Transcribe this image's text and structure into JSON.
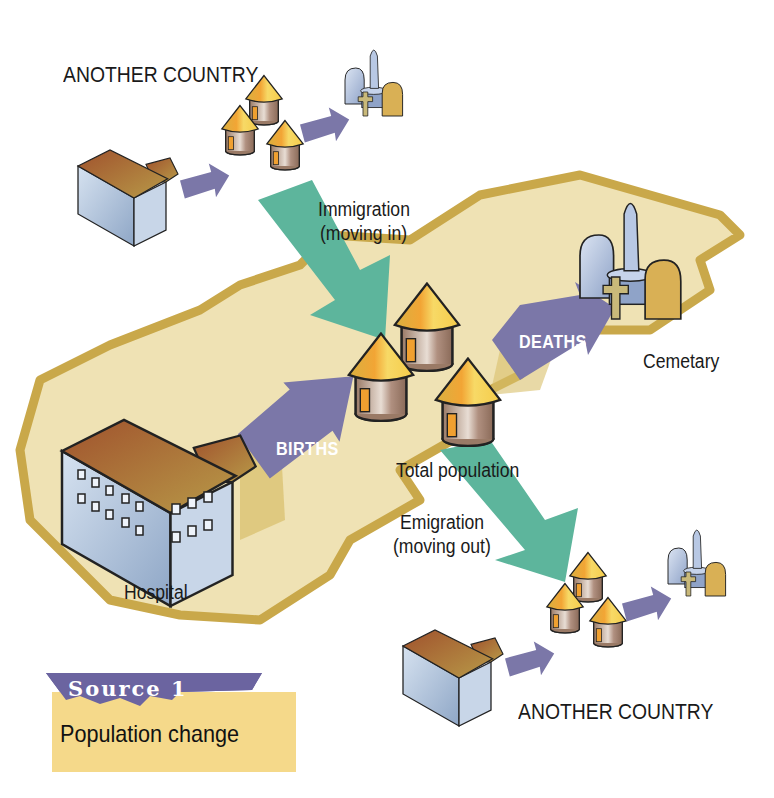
{
  "diagram": {
    "title_tab": "Source 1",
    "caption": "Population change",
    "labels": {
      "another_country_top": "ANOTHER COUNTRY",
      "another_country_bottom": "ANOTHER COUNTRY",
      "immigration_line1": "Immigration",
      "immigration_line2": "(moving in)",
      "emigration_line1": "Emigration",
      "emigration_line2": "(moving out)",
      "total_population": "Total population",
      "hospital": "Hospital",
      "cemetery": "Cemetary"
    },
    "arrows": {
      "births": "BIRTHS",
      "deaths": "DEATHS"
    },
    "colors": {
      "land_fill": "#efe2b4",
      "land_border": "#c9a84a",
      "flow_arrow": "#7b77a8",
      "migration_arrow": "#5db59c",
      "tab_purple": "#6b64a0",
      "caption_bg": "#f5d98a",
      "building_wall": "#b4c6de",
      "building_roof": "#b07a43",
      "hut_roof": "#f0c54a",
      "hut_wall": "#a88a78"
    }
  }
}
